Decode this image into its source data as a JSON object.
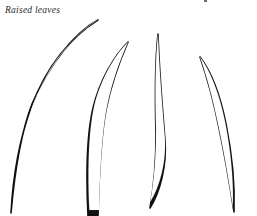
{
  "page": {
    "width": 257,
    "height": 216,
    "background_color": "#ffffff",
    "ink_color": "#111111",
    "caption_color": "#2b2b2b"
  },
  "caption": {
    "text": "Raised leaves"
  },
  "artifacts": {
    "top_edge_speck": {
      "name": "cropped-text-remnant",
      "x": 204,
      "y": 0,
      "color": "#3a3a3a"
    }
  },
  "illustration": {
    "title": "Raised leaves",
    "style": "hand-drawn ink outline",
    "subject": "four elongated curved leaf blades",
    "leaf_count": 4,
    "leaves": [
      {
        "id": "leaf-1",
        "label": "leftmost leaf",
        "tip": {
          "x": 98,
          "y": 20
        },
        "base": {
          "x": 11,
          "y": 213
        },
        "curve_direction": "arcs up and to the right",
        "closed_at_base": true,
        "outline_path": "M 98 20 C 76 32, 50 62, 32 104 C 22 130, 15 168, 11 213 C 13 176, 20 138, 31 108 C 46 66, 72 36, 98 20 Z",
        "midline_path": "M 96 23 C 74 36, 50 66, 33 106 C 23 134, 16 172, 12 210"
      },
      {
        "id": "leaf-2",
        "label": "second leaf from left",
        "tip": {
          "x": 128,
          "y": 42
        },
        "base": {
          "x": 92,
          "y": 216
        },
        "curve_direction": "arcs up and to the right, runs off bottom edge",
        "closed_at_base": false,
        "outline_path": "M 128 42 C 114 56, 100 80, 93 108 C 87 134, 86 176, 88 216 L 98 216 C 99 176, 101 136, 106 110 C 112 80, 121 58, 128 42 Z",
        "midline_path": "M 127 45 C 112 60, 100 84, 94 110 C 89 138, 88 180, 90 214"
      },
      {
        "id": "leaf-3",
        "label": "third leaf, narrow and upright",
        "tip": {
          "x": 158,
          "y": 34
        },
        "base": {
          "x": 150,
          "y": 208
        },
        "curve_direction": "nearly vertical with slight left lean at base",
        "closed_at_base": true,
        "outline_path": "M 158 34 C 159 64, 162 104, 165 140 C 167 166, 160 192, 150 208 C 154 186, 156 160, 156 134 C 155 98, 155 62, 158 34 Z",
        "midline_path": "M 158 38 C 159 70, 162 108, 164 142 C 165 168, 158 194, 151 206"
      },
      {
        "id": "leaf-4",
        "label": "rightmost leaf",
        "tip": {
          "x": 200,
          "y": 57
        },
        "base": {
          "x": 234,
          "y": 212
        },
        "curve_direction": "arcs down and to the right",
        "closed_at_base": true,
        "outline_path": "M 200 57 C 210 70, 220 94, 226 124 C 232 154, 235 186, 234 212 C 230 186, 225 156, 219 128 C 213 98, 206 74, 200 57 Z",
        "midline_path": "M 201 60 C 211 74, 221 98, 227 128 C 232 158, 234 188, 234 210"
      }
    ]
  }
}
